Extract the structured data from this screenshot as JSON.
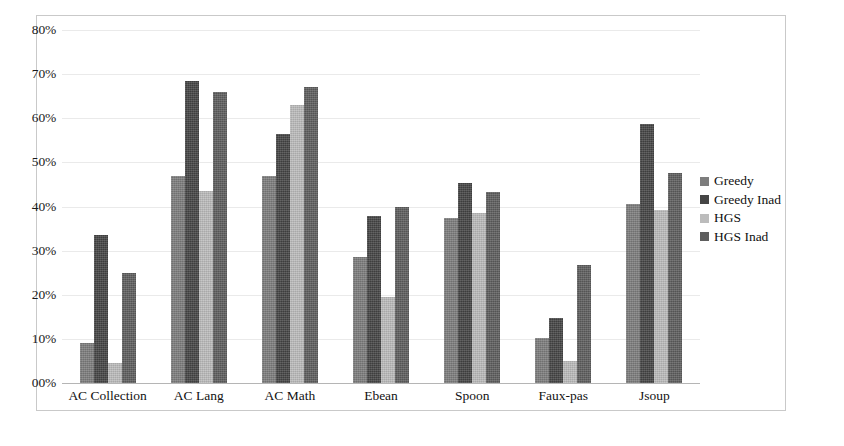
{
  "chart_data": {
    "type": "bar",
    "title": "",
    "subtitle": "",
    "xlabel": "",
    "ylabel": "",
    "ylim": [
      0,
      80
    ],
    "ytick_values": [
      0,
      10,
      20,
      30,
      40,
      50,
      60,
      70,
      80
    ],
    "ytick_labels": [
      "00%",
      "10%",
      "20%",
      "30%",
      "40%",
      "50%",
      "60%",
      "70%",
      "80%"
    ],
    "grid": true,
    "legend_position": "right",
    "categories": [
      "AC Collection",
      "AC Lang",
      "AC Math",
      "Ebean",
      "Spoon",
      "Faux-pas",
      "Jsoup"
    ],
    "series": [
      {
        "name": "Greedy",
        "color": "#7d7d7d",
        "values": [
          9.0,
          47.0,
          47.0,
          28.5,
          37.3,
          10.2,
          40.5
        ]
      },
      {
        "name": "Greedy Inad",
        "color": "#454545",
        "values": [
          33.5,
          68.5,
          56.5,
          37.8,
          45.3,
          14.8,
          58.8
        ]
      },
      {
        "name": "HGS",
        "color": "#bcbcbc",
        "values": [
          4.5,
          43.5,
          63.0,
          19.5,
          38.5,
          5.0,
          39.3
        ]
      },
      {
        "name": "HGS Inad",
        "color": "#5e5e5e",
        "values": [
          25.0,
          66.0,
          67.0,
          40.0,
          43.3,
          26.7,
          47.5
        ]
      }
    ]
  },
  "legend": {
    "items": [
      {
        "label": "Greedy"
      },
      {
        "label": "Greedy Inad"
      },
      {
        "label": "HGS"
      },
      {
        "label": "HGS Inad"
      }
    ]
  },
  "axes": {
    "y_labels": [
      "80%",
      "70%",
      "60%",
      "50%",
      "40%",
      "30%",
      "20%",
      "10%",
      "00%"
    ],
    "x_labels": [
      "AC Collection",
      "AC Lang",
      "AC Math",
      "Ebean",
      "Spoon",
      "Faux-pas",
      "Jsoup"
    ]
  },
  "colors": {
    "series_0": "#7d7d7d",
    "series_1": "#454545",
    "series_2": "#bcbcbc",
    "series_3": "#5e5e5e",
    "grid": "#eaeaea",
    "frame": "#c9c9c9",
    "text": "#101010"
  }
}
